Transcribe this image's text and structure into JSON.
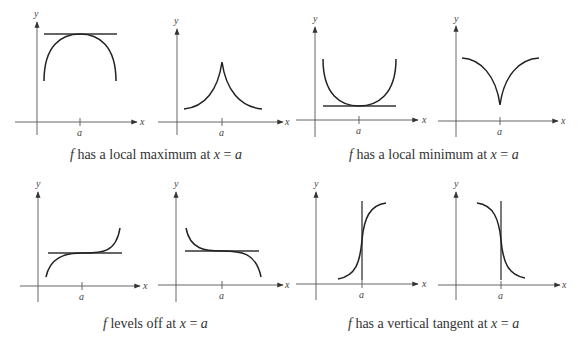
{
  "figure": {
    "axis_labels": {
      "x": "x",
      "y": "y",
      "tick": "a"
    },
    "groups": [
      {
        "caption_f": "f",
        "caption_text": " has a local maximum at ",
        "caption_x": "x",
        "caption_eq": " = ",
        "caption_a": "a",
        "panels": [
          "local-max-smooth",
          "local-max-cusp"
        ]
      },
      {
        "caption_f": "f",
        "caption_text": " has a local minimum at ",
        "caption_x": "x",
        "caption_eq": " = ",
        "caption_a": "a",
        "panels": [
          "local-min-smooth",
          "local-min-cusp"
        ]
      },
      {
        "caption_f": "f",
        "caption_text": " levels off at ",
        "caption_x": "x",
        "caption_eq": " = ",
        "caption_a": "a",
        "panels": [
          "levels-off-increasing",
          "levels-off-decreasing"
        ]
      },
      {
        "caption_f": "f",
        "caption_text": " has a vertical tangent at ",
        "caption_x": "x",
        "caption_eq": " = ",
        "caption_a": "a",
        "panels": [
          "vertical-tangent-increasing",
          "vertical-tangent-decreasing"
        ]
      }
    ]
  }
}
